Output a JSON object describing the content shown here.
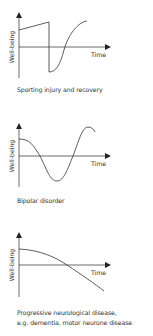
{
  "panels": [
    {
      "id": "sporting-injury",
      "ylabel": "Well-being",
      "xlabel": "Time",
      "caption": [
        "Sporting injury and recovery"
      ],
      "curve": "M19,30 L49,22 L49,72 C56,72 60,65 64,50 C68,35 78,22 87,21"
    },
    {
      "id": "bipolar",
      "ylabel": "Well-being",
      "xlabel": "Time",
      "caption": [
        "Bipolar disorder"
      ],
      "curve": "M19,139 C30,139 33,145 40,156 C47,170 50,181 57,181 C64,181 68,168 73,156 C78,143 82,127 88,127 C92,127 94,130 95,132"
    },
    {
      "id": "progressive-neurological",
      "ylabel": "Well-being",
      "xlabel": "Time",
      "caption": [
        "Progressive neurological disease,",
        "e.g. dementia, motor neurone disease"
      ],
      "curve": "M19,249 C40,250 55,257 67,265 C82,275 95,284 104,291"
    }
  ],
  "chart_data": [
    {
      "type": "line",
      "title": "Sporting injury and recovery",
      "xlabel": "Time",
      "ylabel": "Well-being",
      "description": "Gradual rise, sudden sharp drop below zero (injury), then S-shaped recovery above baseline",
      "x": [
        0,
        1,
        1,
        2,
        3,
        4
      ],
      "y": [
        0.6,
        0.9,
        -0.9,
        -0.8,
        0.1,
        0.9
      ]
    },
    {
      "type": "line",
      "title": "Bipolar disorder",
      "xlabel": "Time",
      "ylabel": "Well-being",
      "description": "Sinusoidal oscillation between high and low well-being",
      "x": [
        0,
        1,
        2,
        3,
        4
      ],
      "y": [
        0.6,
        0,
        -0.9,
        0,
        0.9
      ]
    },
    {
      "type": "line",
      "title": "Progressive neurological disease, e.g. dementia, motor neurone disease",
      "xlabel": "Time",
      "ylabel": "Well-being",
      "description": "Steady accelerating decline from positive to negative well-being",
      "x": [
        0,
        1,
        2,
        3
      ],
      "y": [
        0.6,
        0.35,
        0,
        -0.9
      ]
    }
  ]
}
